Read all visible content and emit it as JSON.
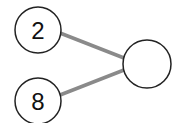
{
  "diagram": {
    "nodes": [
      {
        "id": "top",
        "label": "2",
        "cx": 38,
        "cy": 30,
        "r": 23
      },
      {
        "id": "bottom",
        "label": "8",
        "cx": 38,
        "cy": 101,
        "r": 23
      },
      {
        "id": "result",
        "label": "",
        "cx": 147,
        "cy": 64,
        "r": 24
      }
    ],
    "edges": [
      {
        "from": "top",
        "to": "result"
      },
      {
        "from": "bottom",
        "to": "result"
      }
    ],
    "colors": {
      "edge": "#8a8a8a",
      "node_stroke": "#222222",
      "node_fill": "#ffffff",
      "text": "#111111"
    }
  }
}
